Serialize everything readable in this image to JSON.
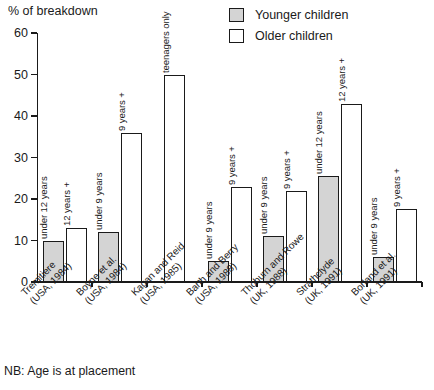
{
  "chart_data": {
    "type": "bar",
    "title": "",
    "ylabel": "% of breakdown",
    "xlabel": "",
    "ylim": [
      0,
      60
    ],
    "yticks": [
      0,
      10,
      20,
      30,
      40,
      50,
      60
    ],
    "grid": false,
    "legend_position": "top-right",
    "categories": [
      "Tremitiere (USA, 1984)",
      "Boyne et al. (USA, 1984)",
      "Kagan and Reid (USA, 1985)",
      "Barth and Berry (USA, 1988)",
      "Thoburn and Rowe (UK, 1988)",
      "Strathclyde (UK, 1991)",
      "Borland et al. (UK, 1991)"
    ],
    "series": [
      {
        "name": "Younger children",
        "color": "#d4d4d4",
        "values": [
          10,
          12,
          null,
          5,
          11,
          25.5,
          6
        ]
      },
      {
        "name": "Older children",
        "color": "#ffffff",
        "values": [
          13,
          36,
          50,
          23,
          22,
          43,
          17.5
        ]
      }
    ],
    "annotations": [
      "NB: Age is at placement"
    ]
  },
  "axis": {
    "y_title": "% of breakdown",
    "y_ticks": [
      "0",
      "10",
      "20",
      "30",
      "40",
      "50",
      "60"
    ]
  },
  "legend": {
    "items": [
      {
        "label": "Younger children",
        "swatch": "younger"
      },
      {
        "label": "Older children",
        "swatch": "older"
      }
    ]
  },
  "groups": [
    {
      "id": "tremitiere",
      "label_line1": "Tremitiere",
      "label_line2": "(USA, 1984)",
      "bars": [
        {
          "kind": "younger",
          "value": 10,
          "label": "under 12 years"
        },
        {
          "kind": "older",
          "value": 13,
          "label": "12 years +"
        }
      ]
    },
    {
      "id": "boyne",
      "label_line1": "Boyne et al.",
      "label_line2": "(USA, 1984)",
      "bars": [
        {
          "kind": "younger",
          "value": 12,
          "label": "under 9 years"
        },
        {
          "kind": "older",
          "value": 36,
          "label": "9 years +"
        }
      ]
    },
    {
      "id": "kagan-reid",
      "label_line1": "Kagan and Reid",
      "label_line2": "(USA, 1985)",
      "bars": [
        {
          "kind": "older",
          "value": 50,
          "label": "teenagers only"
        }
      ]
    },
    {
      "id": "barth-berry",
      "label_line1": "Barth and Berry",
      "label_line2": "(USA, 1988)",
      "bars": [
        {
          "kind": "younger",
          "value": 5,
          "label": "under 9 years"
        },
        {
          "kind": "older",
          "value": 23,
          "label": "9 years +"
        }
      ]
    },
    {
      "id": "thoburn-rowe",
      "label_line1": "Thoburn and Rowe",
      "label_line2": "(UK, 1988)",
      "bars": [
        {
          "kind": "younger",
          "value": 11,
          "label": "under 9 years"
        },
        {
          "kind": "older",
          "value": 22,
          "label": "9 years +"
        }
      ]
    },
    {
      "id": "strathclyde",
      "label_line1": "Strathclyde",
      "label_line2": "(UK, 1991)",
      "bars": [
        {
          "kind": "younger",
          "value": 25.5,
          "label": "under 12 years"
        },
        {
          "kind": "older",
          "value": 43,
          "label": "12 years +"
        }
      ]
    },
    {
      "id": "borland",
      "label_line1": "Borland et al.",
      "label_line2": "(UK, 1991)",
      "bars": [
        {
          "kind": "younger",
          "value": 6,
          "label": "under 9 years"
        },
        {
          "kind": "older",
          "value": 17.5,
          "label": "9 years +"
        }
      ]
    }
  ],
  "footnote": "NB: Age is at placement"
}
